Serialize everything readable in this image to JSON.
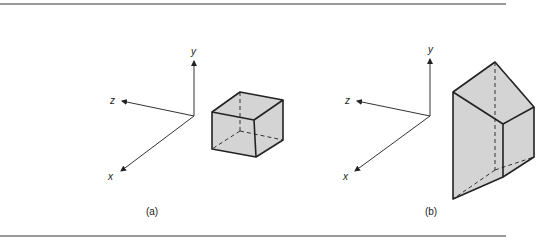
{
  "figure": {
    "panels": [
      {
        "id": "a",
        "caption": "(a)",
        "axes": {
          "x_label": "x",
          "y_label": "y",
          "z_label": "z"
        },
        "shape": "cube"
      },
      {
        "id": "b",
        "caption": "(b)",
        "axes": {
          "x_label": "x",
          "y_label": "y",
          "z_label": "z"
        },
        "shape": "sheared prism"
      }
    ],
    "colors": {
      "face_fill": "#d4d4d4",
      "edge": "#222222",
      "rule": "#777777"
    }
  }
}
